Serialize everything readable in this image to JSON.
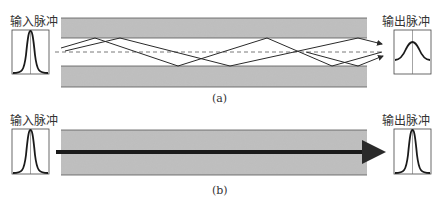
{
  "panel_a": {
    "input_label": "输入脉冲",
    "output_label": "输出脉冲",
    "caption": "(a)"
  },
  "panel_b": {
    "input_label": "输入脉冲",
    "output_label": "输出脉冲",
    "caption": "(b)"
  },
  "colors": {
    "cladding": "#b8b8b8",
    "core": "#f4f4f4",
    "ray": "#2a2a2a",
    "axis_dash": "#555555",
    "pulse": "#1a1a1a"
  }
}
